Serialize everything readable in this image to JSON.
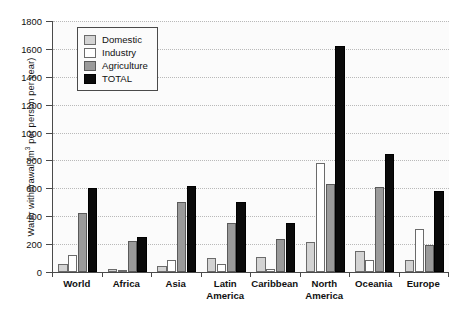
{
  "chart_data": {
    "type": "bar",
    "title": "",
    "subtitle": "",
    "xlabel": "",
    "ylabel": "Water withdrawal (m³ per person per year)",
    "ylabel_prefix": "Water withdrawal (m",
    "ylabel_exponent": "3",
    "ylabel_suffix": " per person per year)",
    "ylim": [
      0,
      1800
    ],
    "ytick_step": 200,
    "ytick_labels": [
      "0",
      "200",
      "400",
      "600",
      "800",
      "1000",
      "1200",
      "1400",
      "1600",
      "1800"
    ],
    "ytick_values": [
      0,
      200,
      400,
      600,
      800,
      1000,
      1200,
      1400,
      1600,
      1800
    ],
    "grid": true,
    "grid_axis": "y",
    "legend_position": "upper-left-inside",
    "categories": [
      "World",
      "Africa",
      "Asia",
      "Latin\nAmerica",
      "Caribbean",
      "North\nAmerica",
      "Oceania",
      "Europe"
    ],
    "category_labels_flat": [
      "World",
      "Africa",
      "Asia",
      "Latin America",
      "Caribbean",
      "North America",
      "Oceania",
      "Europe"
    ],
    "series": [
      {
        "name": "Domestic",
        "color": "#d3d3d3",
        "values": [
          55,
          20,
          45,
          100,
          105,
          215,
          150,
          85
        ]
      },
      {
        "name": "Industry",
        "color": "#ffffff",
        "values": [
          125,
          15,
          85,
          55,
          25,
          780,
          85,
          310
        ]
      },
      {
        "name": "Agriculture",
        "color": "#9a9a9a",
        "values": [
          420,
          225,
          500,
          350,
          240,
          630,
          610,
          195
        ]
      },
      {
        "name": "TOTAL",
        "color": "#0a0a0a",
        "values": [
          600,
          250,
          620,
          500,
          350,
          1620,
          845,
          580
        ]
      }
    ]
  },
  "legend": {
    "items": [
      {
        "label": "Domestic",
        "key": "domestic"
      },
      {
        "label": "Industry",
        "key": "industry"
      },
      {
        "label": "Agriculture",
        "key": "agriculture"
      },
      {
        "label": "TOTAL",
        "key": "total"
      }
    ]
  },
  "colors": {
    "domestic": "#d3d3d3",
    "industry": "#ffffff",
    "agriculture": "#9a9a9a",
    "total": "#0a0a0a",
    "axis": "#4a4a4a",
    "grid": "#b9b9b9",
    "plot_background": "#fbfbfb",
    "page_background": "#ffffff"
  }
}
